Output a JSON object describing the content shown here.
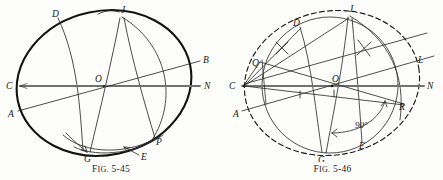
{
  "page": {
    "background_color": "#fdfdfb",
    "ink_color": "#1a1a1a",
    "width": 443,
    "height": 180
  },
  "figures": [
    {
      "id": "fig-5-45",
      "caption_prefix": "F",
      "caption_smallcaps": "IG.",
      "caption_number": "5-45",
      "caption_full": "Fig. 5-45",
      "description": "Isometric-style ellipse construction with inscribed circle arcs and chord lines",
      "point_labels": [
        {
          "name": "D",
          "x": 52,
          "y": 13
        },
        {
          "name": "J",
          "x": 122,
          "y": 10
        },
        {
          "name": "B",
          "x": 204,
          "y": 59
        },
        {
          "name": "N",
          "x": 207,
          "y": 84
        },
        {
          "name": "C",
          "x": 8,
          "y": 82
        },
        {
          "name": "A",
          "x": 10,
          "y": 112
        },
        {
          "name": "O",
          "x": 96,
          "y": 80
        },
        {
          "name": "P",
          "x": 157,
          "y": 141
        },
        {
          "name": "E",
          "x": 142,
          "y": 157
        },
        {
          "name": "G",
          "x": 91,
          "y": 160
        }
      ],
      "ellipse": {
        "cx": 104,
        "cy": 83,
        "rx": 88,
        "ry": 73,
        "rotation": -12
      },
      "colors": {
        "outline": "#141414",
        "construction": "#2b2b2b",
        "axis_gray": "#8a8a8a"
      }
    },
    {
      "id": "fig-5-46",
      "caption_prefix": "F",
      "caption_smallcaps": "IG.",
      "caption_number": "5-46",
      "caption_full": "Fig. 5-46",
      "description": "Ellipse construction with dashed outline, bisector tick marks, and a 90 degree angle annotation",
      "point_labels": [
        {
          "name": "D",
          "x": 72,
          "y": 22
        },
        {
          "name": "J",
          "x": 128,
          "y": 8
        },
        {
          "name": "L",
          "x": 196,
          "y": 59
        },
        {
          "name": "N",
          "x": 206,
          "y": 84
        },
        {
          "name": "Q",
          "x": 32,
          "y": 62
        },
        {
          "name": "C",
          "x": 8,
          "y": 82
        },
        {
          "name": "O",
          "x": 112,
          "y": 78
        },
        {
          "name": "A",
          "x": 14,
          "y": 113
        },
        {
          "name": "R",
          "x": 177,
          "y": 106
        },
        {
          "name": "E",
          "x": 138,
          "y": 145
        },
        {
          "name": "G",
          "x": 98,
          "y": 161
        }
      ],
      "annotations": [
        {
          "name": "angle-label",
          "text": "90°",
          "x": 145,
          "y": 124
        }
      ],
      "ellipse": {
        "cx": 110,
        "cy": 83,
        "rx": 88,
        "ry": 73,
        "rotation": -10
      },
      "colors": {
        "outline_dashed": "#1a1a1a",
        "construction": "#2f2f2f",
        "axis_gray": "#8a8a8a"
      }
    }
  ]
}
